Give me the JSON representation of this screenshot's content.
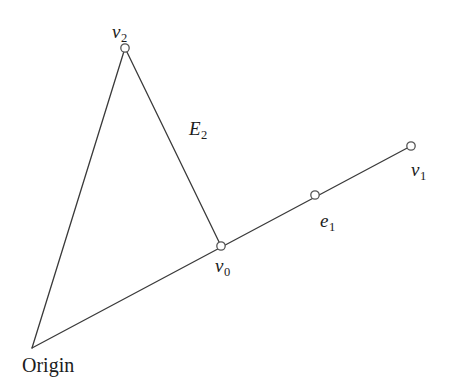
{
  "figure": {
    "background_color": "#ffffff",
    "stroke_color": "#3a3a3a",
    "marker_stroke_color": "#555555",
    "marker_fill_color": "#ffffff",
    "text_color": "#1c1c1c",
    "width": 457,
    "height": 391
  },
  "labels": {
    "v2": {
      "base": "v",
      "sub": "2"
    },
    "v1": {
      "base": "v",
      "sub": "1"
    },
    "v0": {
      "base": "v",
      "sub": "0"
    },
    "e1": {
      "base": "e",
      "sub": "1"
    },
    "E2": {
      "base": "E",
      "sub": "2"
    },
    "origin": {
      "base": "Origin",
      "sub": ""
    }
  },
  "chart_data": {
    "type": "scatter",
    "xlabel": "",
    "ylabel": "",
    "xlim": [
      0,
      457
    ],
    "ylim": [
      0,
      391
    ],
    "grid": false,
    "legend": "none",
    "points": [
      {
        "name": "Origin",
        "label": "Origin",
        "x": 32,
        "y": 348,
        "marker": "none",
        "label_x": 22,
        "label_y": 355
      },
      {
        "name": "v2",
        "label": "v2",
        "x": 125,
        "y": 48,
        "marker": "open-circle",
        "label_x": 112,
        "label_y": 22
      },
      {
        "name": "v0",
        "label": "v0",
        "x": 221,
        "y": 246,
        "marker": "open-circle",
        "label_x": 215,
        "label_y": 256
      },
      {
        "name": "e1",
        "label": "e1",
        "x": 315,
        "y": 195,
        "marker": "open-circle",
        "label_x": 320,
        "label_y": 211
      },
      {
        "name": "v1",
        "label": "v1",
        "x": 411,
        "y": 146,
        "marker": "open-circle",
        "label_x": 411,
        "label_y": 160
      }
    ],
    "edges": [
      {
        "name": "origin-to-v2",
        "from": "Origin",
        "to": "v2",
        "x1": 32,
        "y1": 348,
        "x2": 125,
        "y2": 48,
        "label": ""
      },
      {
        "name": "v2-to-v0",
        "from": "v2",
        "to": "v0",
        "x1": 125,
        "y1": 48,
        "x2": 221,
        "y2": 246,
        "label": "E2"
      },
      {
        "name": "origin-to-v1",
        "from": "Origin",
        "to": "v1",
        "x1": 32,
        "y1": 348,
        "x2": 411,
        "y2": 146,
        "label": "e1"
      }
    ],
    "marker_radius": 4.2,
    "stroke_width": 1.3
  }
}
